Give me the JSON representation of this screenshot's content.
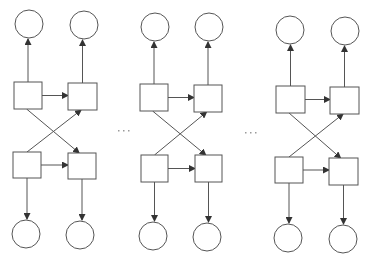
{
  "diagram": {
    "type": "repeated-block-network",
    "colors": {
      "stroke": "#555555",
      "fill": "#ffffff",
      "ellipsis": "#9a9a9a"
    },
    "separators": [
      {
        "label": "...",
        "x": 118,
        "y": 130
      },
      {
        "label": "...",
        "x": 245,
        "y": 132
      }
    ],
    "blocks": [
      {
        "id": "block-1",
        "top_circles": [
          {
            "cx": 29,
            "cy": 24,
            "r": 14
          },
          {
            "cx": 84,
            "cy": 25,
            "r": 14
          }
        ],
        "squares": {
          "top_left": {
            "x": 14,
            "y": 82,
            "w": 28,
            "h": 27
          },
          "top_right": {
            "x": 68,
            "y": 83,
            "w": 29,
            "h": 27
          },
          "bottom_left": {
            "x": 13,
            "y": 152,
            "w": 28,
            "h": 26
          },
          "bottom_right": {
            "x": 68,
            "y": 153,
            "w": 28,
            "h": 26
          }
        },
        "bottom_circles": [
          {
            "cx": 26,
            "cy": 234,
            "r": 14
          },
          {
            "cx": 80,
            "cy": 235,
            "r": 14
          }
        ]
      },
      {
        "id": "block-2",
        "top_circles": [
          {
            "cx": 155,
            "cy": 27,
            "r": 14
          },
          {
            "cx": 209,
            "cy": 27,
            "r": 14
          }
        ],
        "squares": {
          "top_left": {
            "x": 140,
            "y": 84,
            "w": 28,
            "h": 27
          },
          "top_right": {
            "x": 194,
            "y": 85,
            "w": 28,
            "h": 27
          },
          "bottom_left": {
            "x": 141,
            "y": 155,
            "w": 27,
            "h": 27
          },
          "bottom_right": {
            "x": 195,
            "y": 155,
            "w": 27,
            "h": 27
          }
        },
        "bottom_circles": [
          {
            "cx": 153,
            "cy": 236,
            "r": 14
          },
          {
            "cx": 207,
            "cy": 237,
            "r": 14
          }
        ]
      },
      {
        "id": "block-3",
        "top_circles": [
          {
            "cx": 290,
            "cy": 30,
            "r": 14
          },
          {
            "cx": 345,
            "cy": 31,
            "r": 14
          }
        ],
        "squares": {
          "top_left": {
            "x": 276,
            "y": 86,
            "w": 29,
            "h": 27
          },
          "top_right": {
            "x": 330,
            "y": 87,
            "w": 29,
            "h": 27
          },
          "bottom_left": {
            "x": 275,
            "y": 157,
            "w": 28,
            "h": 26
          },
          "bottom_right": {
            "x": 329,
            "y": 158,
            "w": 29,
            "h": 27
          }
        },
        "bottom_circles": [
          {
            "cx": 288,
            "cy": 238,
            "r": 14
          },
          {
            "cx": 343,
            "cy": 239,
            "r": 14
          }
        ]
      }
    ]
  }
}
